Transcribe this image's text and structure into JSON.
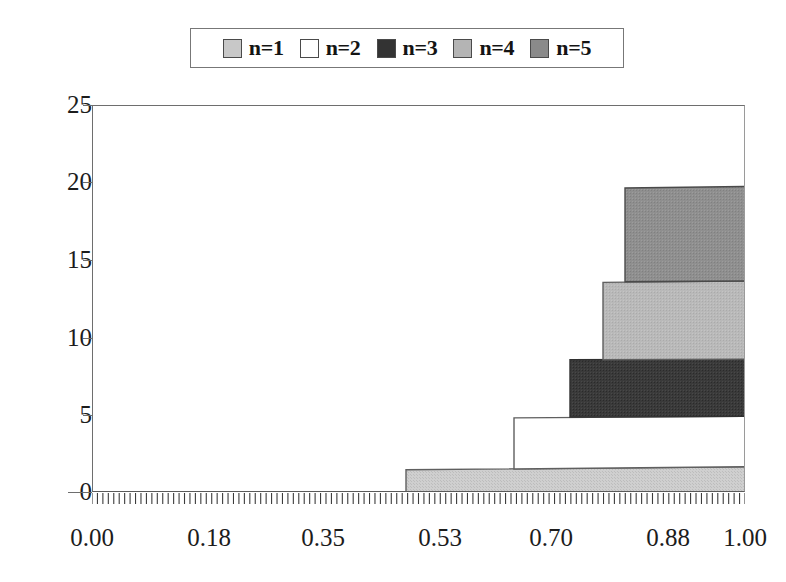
{
  "chart_data": {
    "type": "area",
    "title": "",
    "subtitle": "",
    "xlabel": "",
    "ylabel": "",
    "xlim": [
      0.0,
      1.0
    ],
    "ylim": [
      0,
      25
    ],
    "grid": false,
    "legend_position": "top-center",
    "stacked": true,
    "x_tick_labels": [
      "0.00",
      "0.18",
      "0.35",
      "0.53",
      "0.70",
      "0.88",
      "1.00"
    ],
    "x_tick_values": [
      0.0,
      0.18,
      0.35,
      0.53,
      0.7,
      0.88,
      1.0
    ],
    "y_tick_labels": [
      "0",
      "5",
      "10",
      "15",
      "20",
      "25"
    ],
    "y_tick_values": [
      0,
      5,
      10,
      15,
      20,
      25
    ],
    "x_minor_tick_count": 120,
    "legend_entries": [
      {
        "label": "n=1",
        "color": "#c8c8c8",
        "swatch_name": "legend-swatch-n1"
      },
      {
        "label": "n=2",
        "color": "#ffffff",
        "swatch_name": "legend-swatch-n2"
      },
      {
        "label": "n=3",
        "color": "#333333",
        "swatch_name": "legend-swatch-n3"
      },
      {
        "label": "n=4",
        "color": "#b4b4b4",
        "swatch_name": "legend-swatch-n4"
      },
      {
        "label": "n=5",
        "color": "#8a8a8a",
        "swatch_name": "legend-swatch-n5"
      }
    ],
    "series": [
      {
        "name": "n=1",
        "color": "#c8c8c8",
        "start_x": 0.48,
        "points": [
          {
            "x": 0.48,
            "y_bottom": 0.0,
            "y_top": 0.0
          },
          {
            "x": 0.48,
            "y_bottom": 0.0,
            "y_top": 1.5
          },
          {
            "x": 1.0,
            "y_bottom": 0.0,
            "y_top": 1.7
          }
        ],
        "final_value": 1.7
      },
      {
        "name": "n=2",
        "color": "#ffffff",
        "start_x": 0.645,
        "points": [
          {
            "x": 0.645,
            "y_bottom": 1.55,
            "y_top": 1.55
          },
          {
            "x": 0.645,
            "y_bottom": 1.55,
            "y_top": 4.85
          },
          {
            "x": 1.0,
            "y_bottom": 1.7,
            "y_top": 4.95
          }
        ],
        "final_value": 3.25
      },
      {
        "name": "n=3",
        "color": "#333333",
        "start_x": 0.73,
        "points": [
          {
            "x": 0.73,
            "y_bottom": 4.9,
            "y_top": 4.9
          },
          {
            "x": 0.73,
            "y_bottom": 4.9,
            "y_top": 8.6
          },
          {
            "x": 1.0,
            "y_bottom": 4.95,
            "y_top": 8.65
          }
        ],
        "final_value": 3.7
      },
      {
        "name": "n=4",
        "color": "#b4b4b4",
        "start_x": 0.781,
        "points": [
          {
            "x": 0.781,
            "y_bottom": 8.6,
            "y_top": 8.6
          },
          {
            "x": 0.781,
            "y_bottom": 8.6,
            "y_top": 13.6
          },
          {
            "x": 1.0,
            "y_bottom": 8.65,
            "y_top": 13.7
          }
        ],
        "final_value": 5.05
      },
      {
        "name": "n=5",
        "color": "#8a8a8a",
        "start_x": 0.815,
        "points": [
          {
            "x": 0.815,
            "y_bottom": 13.65,
            "y_top": 13.65
          },
          {
            "x": 0.815,
            "y_bottom": 13.65,
            "y_top": 19.7
          },
          {
            "x": 1.0,
            "y_bottom": 13.7,
            "y_top": 19.8
          }
        ],
        "final_value": 6.1
      }
    ],
    "cumulative_totals_at_x1": [
      1.7,
      4.95,
      8.65,
      13.7,
      19.8
    ]
  },
  "legend": {
    "items": [
      {
        "label": "n=1"
      },
      {
        "label": "n=2"
      },
      {
        "label": "n=3"
      },
      {
        "label": "n=4"
      },
      {
        "label": "n=5"
      }
    ]
  },
  "axes": {
    "y_labels": [
      "25",
      "20",
      "15",
      "10",
      "5",
      "0"
    ],
    "x_labels": [
      "0.00",
      "0.18",
      "0.35",
      "0.53",
      "0.70",
      "0.88",
      "1.00"
    ]
  },
  "colors": {
    "axis": "#6e6e6e",
    "text": "#1c1c1c",
    "legend_border": "#777777",
    "series_border": "#5a5a5a"
  }
}
